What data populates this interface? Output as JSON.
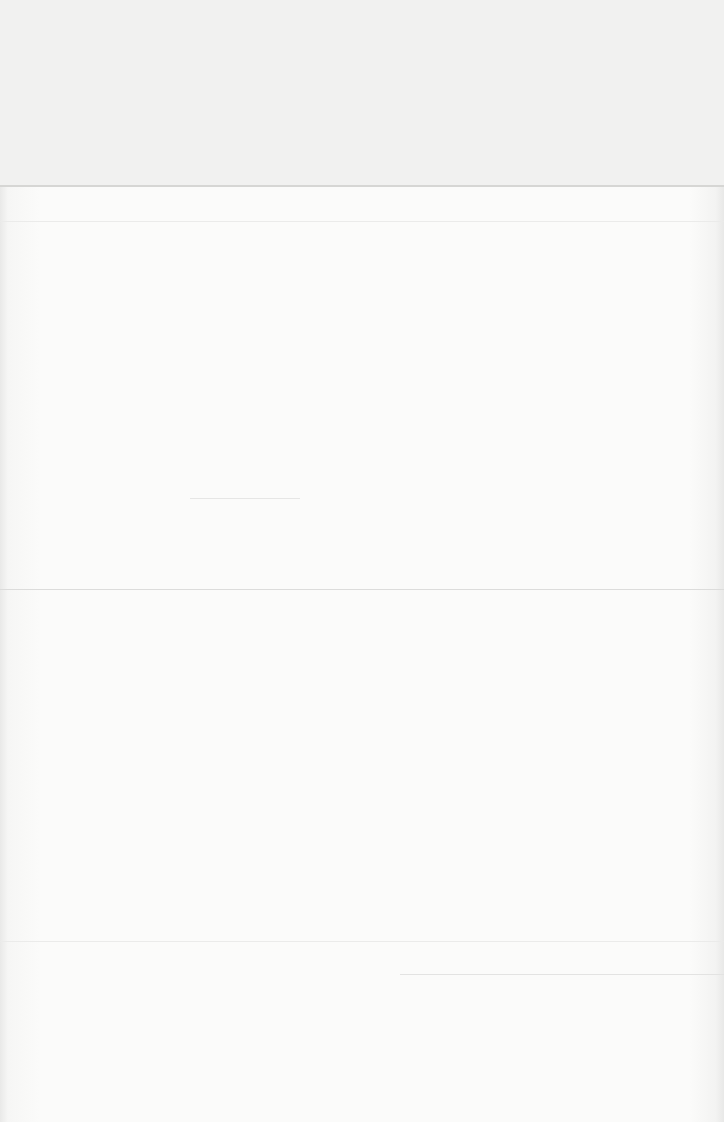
{
  "page": {
    "type": "blank-scanned-page",
    "background_color": "#fbfbfa",
    "rule_color": "#d6d6d4",
    "text_content": ""
  }
}
